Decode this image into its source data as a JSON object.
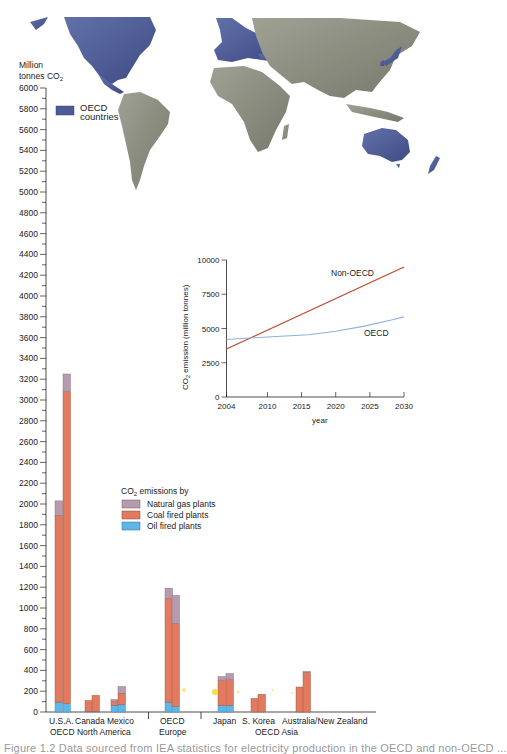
{
  "chart_data": [
    {
      "type": "bar",
      "stacked": true,
      "ylabel": "Million tonnes CO2",
      "ylabel_lines": [
        "Million",
        "tonnes CO"
      ],
      "ylim": [
        0,
        6000
      ],
      "ytick_step": 200,
      "yticks": [
        0,
        200,
        400,
        600,
        800,
        1000,
        1200,
        1400,
        1600,
        1800,
        2000,
        2200,
        2400,
        2600,
        2800,
        3000,
        3200,
        3400,
        3600,
        3800,
        4000,
        4200,
        4400,
        4600,
        4800,
        5000,
        5200,
        5400,
        5600,
        5800,
        6000
      ],
      "legend_title": "CO2 emissions by",
      "legend": [
        {
          "name": "Natural gas plants",
          "color": "#b79aad"
        },
        {
          "name": "Coal fired plants",
          "color": "#e27a5f"
        },
        {
          "name": "Oil fired plants",
          "color": "#5fb6e6"
        }
      ],
      "categories": [
        "U.S.A.",
        "Canada",
        "Mexico",
        "OECD Europe",
        "Japan",
        "S. Korea",
        "Australia/New Zealand"
      ],
      "groups": [
        {
          "label": "OECD North America",
          "members": [
            "U.S.A.",
            "Canada",
            "Mexico"
          ]
        },
        {
          "label": "OECD Europe",
          "members": [
            "OECD Europe"
          ]
        },
        {
          "label": "OECD Asia",
          "members": [
            "Japan",
            "S. Korea",
            "Australia/New Zealand"
          ]
        }
      ],
      "bars": [
        {
          "category": "U.S.A.",
          "bar": 1,
          "oil": 95,
          "coal": 1795,
          "gas": 140
        },
        {
          "category": "U.S.A.",
          "bar": 2,
          "oil": 80,
          "coal": 3000,
          "gas": 170
        },
        {
          "category": "Canada",
          "bar": 1,
          "oil": 5,
          "coal": 105,
          "gas": 0
        },
        {
          "category": "Canada",
          "bar": 2,
          "oil": 5,
          "coal": 155,
          "gas": 0
        },
        {
          "category": "Mexico",
          "bar": 1,
          "oil": 65,
          "coal": 35,
          "gas": 20
        },
        {
          "category": "Mexico",
          "bar": 2,
          "oil": 75,
          "coal": 105,
          "gas": 65
        },
        {
          "category": "OECD Europe",
          "bar": 1,
          "oil": 95,
          "coal": 995,
          "gas": 100
        },
        {
          "category": "OECD Europe",
          "bar": 2,
          "oil": 55,
          "coal": 795,
          "gas": 270
        },
        {
          "category": "Japan",
          "bar": 1,
          "oil": 65,
          "coal": 235,
          "gas": 40
        },
        {
          "category": "Japan",
          "bar": 2,
          "oil": 65,
          "coal": 245,
          "gas": 60
        },
        {
          "category": "S. Korea",
          "bar": 1,
          "oil": 0,
          "coal": 130,
          "gas": 0
        },
        {
          "category": "S. Korea",
          "bar": 2,
          "oil": 0,
          "coal": 170,
          "gas": 0
        },
        {
          "category": "Australia/New Zealand",
          "bar": 1,
          "oil": 0,
          "coal": 240,
          "gas": 0
        },
        {
          "category": "Australia/New Zealand",
          "bar": 2,
          "oil": 0,
          "coal": 380,
          "gas": 10
        }
      ],
      "map_legend": {
        "label_lines": [
          "OECD",
          "countries"
        ],
        "color": "#4a5a96"
      }
    },
    {
      "type": "line",
      "xlabel": "year",
      "ylabel": "CO2 emission (million tonnes)",
      "ylabel_parts": [
        "CO",
        "2",
        " emission (million tonnes)"
      ],
      "xlim": [
        2004,
        2030
      ],
      "ylim": [
        0,
        10000
      ],
      "xticks": [
        2004,
        2010,
        2015,
        2020,
        2025,
        2030
      ],
      "yticks": [
        0,
        2500,
        5000,
        7500,
        10000
      ],
      "series": [
        {
          "name": "Non-OECD",
          "color": "#c0442a",
          "x": [
            2004,
            2030
          ],
          "values": [
            3500,
            9500
          ]
        },
        {
          "name": "OECD",
          "color": "#8fb0d8",
          "x": [
            2004,
            2008,
            2012,
            2016,
            2020,
            2024,
            2028,
            2030
          ],
          "values": [
            4200,
            4330,
            4430,
            4550,
            4800,
            5150,
            5600,
            5850
          ]
        }
      ]
    }
  ],
  "labels": {
    "y_unit_line1": "Million",
    "y_unit_line2": "tonnes CO",
    "y_unit_sub": "2",
    "map_legend_line1": "OECD",
    "map_legend_line2": "countries",
    "legend_title_main": "CO",
    "legend_title_sub": "2",
    "legend_title_rest": " emissions by",
    "legend_gas": "Natural gas plants",
    "legend_coal": "Coal fired plants",
    "legend_oil": "Oil fired plants",
    "cat_usa": "U.S.A.",
    "cat_canada": "Canada",
    "cat_mexico": "Mexico",
    "grp_na": "OECD North America",
    "cat_europe_1": "OECD",
    "cat_europe_2": "Europe",
    "cat_japan": "Japan",
    "cat_korea": "S. Korea",
    "cat_aus": "Australia/New Zealand",
    "grp_asia": "OECD Asia",
    "inset_nonoecd": "Non-OECD",
    "inset_oecd": "OECD",
    "inset_xlabel": "year",
    "inset_ylabel_main": "CO",
    "inset_ylabel_sub": "2",
    "inset_ylabel_rest": " emission (million tonnes)"
  },
  "caption": "Figure 1.2   Data sourced from IEA statistics for electricity production in the OECD and non-OECD ..."
}
